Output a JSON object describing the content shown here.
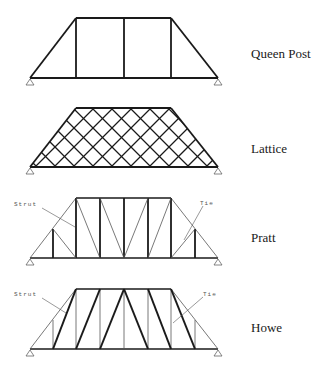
{
  "trusses": [
    {
      "id": "queen-post",
      "label": "Queen Post",
      "label_y": 46
    },
    {
      "id": "lattice",
      "label": "Lattice",
      "label_y": 141
    },
    {
      "id": "pratt",
      "label": "Pratt",
      "label_y": 230,
      "callouts": {
        "left": "Strut",
        "right": "Tie"
      }
    },
    {
      "id": "howe",
      "label": "Howe",
      "label_y": 320,
      "callouts": {
        "left": "Strut",
        "right": "Tie"
      }
    }
  ],
  "colors": {
    "line": "#1a1a1a",
    "thin_line": "#555555",
    "support": "#666666"
  }
}
